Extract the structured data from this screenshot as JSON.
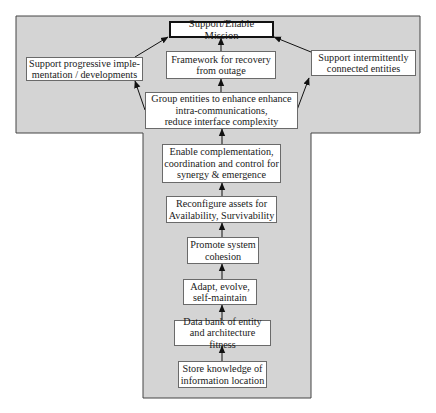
{
  "diagram": {
    "colors": {
      "background": "#ffffff",
      "shape_fill": "#d4d4d4",
      "shape_border": "#444444",
      "box_fill": "#ffffff",
      "arrow": "#111111"
    },
    "nodes": [
      {
        "id": "mission",
        "label": "Support/Enable Mission",
        "emphasis": true
      },
      {
        "id": "progressive",
        "label": "Support progressive imple-\nmentation / developments"
      },
      {
        "id": "framework",
        "label": "Framework for recovery\nfrom outage"
      },
      {
        "id": "intermittent",
        "label": "Support intermittently\nconnected entities"
      },
      {
        "id": "group",
        "label": "Group entities to enhance enhance\nintra-communications,\nreduce interface complexity"
      },
      {
        "id": "enable",
        "label": "Enable complementation,\ncoordination and control for\nsynergy & emergence"
      },
      {
        "id": "reconfigure",
        "label": "Reconfigure assets for\nAvailability, Survivability"
      },
      {
        "id": "promote",
        "label": "Promote system\ncohesion"
      },
      {
        "id": "adapt",
        "label": "Adapt, evolve,\nself-maintain"
      },
      {
        "id": "databank",
        "label": "Data bank of entity\nand architecture fitness"
      },
      {
        "id": "store",
        "label": "Store knowledge of\ninformation location"
      }
    ],
    "edges": [
      {
        "from": "store",
        "to": "databank"
      },
      {
        "from": "databank",
        "to": "adapt"
      },
      {
        "from": "adapt",
        "to": "promote"
      },
      {
        "from": "promote",
        "to": "reconfigure"
      },
      {
        "from": "reconfigure",
        "to": "enable"
      },
      {
        "from": "enable",
        "to": "group"
      },
      {
        "from": "group",
        "to": "progressive"
      },
      {
        "from": "group",
        "to": "framework"
      },
      {
        "from": "group",
        "to": "intermittent"
      },
      {
        "from": "progressive",
        "to": "mission"
      },
      {
        "from": "framework",
        "to": "mission"
      },
      {
        "from": "intermittent",
        "to": "mission"
      }
    ]
  }
}
